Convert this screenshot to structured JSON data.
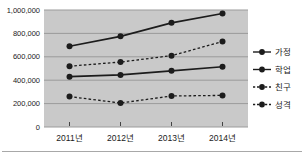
{
  "chart_data": {
    "type": "line",
    "title": "",
    "xlabel": "",
    "ylabel": "",
    "categories": [
      "2011년",
      "2012년",
      "2013년",
      "2014년"
    ],
    "series": [
      {
        "name": "가정",
        "style": "solid",
        "marker": "circle",
        "values": [
          690000,
          775000,
          890000,
          970000
        ]
      },
      {
        "name": "학업",
        "style": "solid",
        "marker": "circle",
        "values": [
          430000,
          445000,
          480000,
          515000
        ]
      },
      {
        "name": "친구",
        "style": "dashed",
        "marker": "circle",
        "values": [
          520000,
          555000,
          610000,
          730000
        ]
      },
      {
        "name": "성격",
        "style": "dashed",
        "marker": "circle",
        "values": [
          260000,
          205000,
          265000,
          270000
        ]
      }
    ],
    "ylim": [
      0,
      1000000
    ],
    "ytick_interval": 200000,
    "ytick_labels": [
      "0",
      "200,000",
      "400,000",
      "600,000",
      "800,000",
      "1,000,000"
    ],
    "grid": "horizontal",
    "legend_position": "right",
    "colors": {
      "line": "#1c1c1c",
      "plot_bg": "#c9c9c9",
      "gridline": "#9b9b9b",
      "tick": "#444444",
      "text": "#1a1a1a",
      "page_bg": "#ffffff"
    }
  }
}
